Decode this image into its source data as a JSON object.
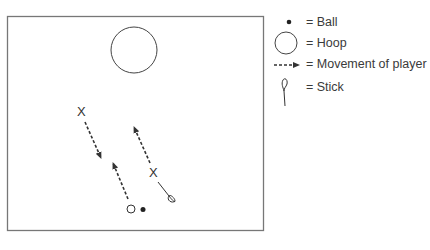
{
  "diagram": {
    "court": {
      "x": 7,
      "y": 16,
      "width": 256,
      "height": 214,
      "stroke": "#777777"
    },
    "hoop": {
      "cx": 134,
      "cy": 50,
      "r": 23
    },
    "players": [
      {
        "id": "player-a",
        "marker": "X",
        "x": 82,
        "y": 112
      },
      {
        "id": "player-b",
        "marker": "X",
        "x": 154,
        "y": 172
      },
      {
        "id": "player-c",
        "marker": "O",
        "x": 131,
        "y": 209
      }
    ],
    "ball": {
      "cx": 143,
      "cy": 209,
      "r": 2.5
    },
    "movements": [
      {
        "from": [
          85,
          122
        ],
        "to": [
          101,
          158
        ]
      },
      {
        "from": [
          128,
          199
        ],
        "to": [
          113,
          163
        ]
      },
      {
        "from": [
          150,
          163
        ],
        "to": [
          134,
          127
        ]
      }
    ],
    "stick": {
      "from": [
        158,
        182
      ],
      "loop": [
        173,
        202
      ]
    },
    "ink_color": "#333333"
  },
  "legend": {
    "items": [
      {
        "symbol": "ball",
        "label": "= Ball"
      },
      {
        "symbol": "hoop",
        "label": "= Hoop"
      },
      {
        "symbol": "movement-arrow",
        "label": "= Movement of player"
      },
      {
        "symbol": "stick",
        "label": "= Stick"
      }
    ]
  }
}
